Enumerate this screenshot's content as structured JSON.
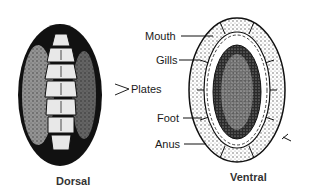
{
  "figure": {
    "dorsal_caption": "Dorsal",
    "ventral_caption": "Ventral",
    "labels": {
      "mouth": "Mouth",
      "gills": "Gills",
      "plates": "Plates",
      "foot": "Foot",
      "anus": "Anus"
    },
    "colors": {
      "ink": "#111111",
      "paper": "#ffffff",
      "stipple": "#8a8a8a"
    }
  }
}
